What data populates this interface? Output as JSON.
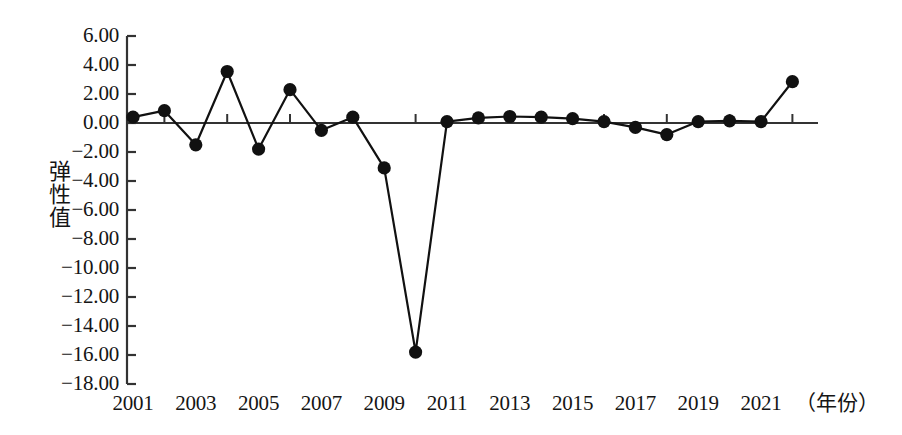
{
  "chart_data": {
    "type": "line",
    "title": "",
    "xlabel": "（年份）",
    "ylabel": "弹性值",
    "x": [
      2001,
      2002,
      2003,
      2004,
      2005,
      2006,
      2007,
      2008,
      2009,
      2010,
      2011,
      2012,
      2013,
      2014,
      2015,
      2016,
      2017,
      2018,
      2019,
      2020,
      2021,
      2022
    ],
    "values": [
      0.4,
      0.85,
      -1.5,
      3.55,
      -1.8,
      2.3,
      -0.5,
      0.4,
      -3.1,
      -15.8,
      0.1,
      0.35,
      0.45,
      0.4,
      0.3,
      0.1,
      -0.3,
      -0.8,
      0.1,
      0.15,
      0.1,
      2.85
    ],
    "series": [
      {
        "name": "弹性值",
        "values": [
          0.4,
          0.85,
          -1.5,
          3.55,
          -1.8,
          2.3,
          -0.5,
          0.4,
          -3.1,
          -15.8,
          0.1,
          0.35,
          0.45,
          0.4,
          0.3,
          0.1,
          -0.3,
          -0.8,
          0.1,
          0.15,
          0.1,
          2.85
        ]
      }
    ],
    "xlim": [
      2000.5,
      2022.6
    ],
    "ylim": [
      -18.0,
      6.0
    ],
    "y_ticks": [
      6.0,
      4.0,
      2.0,
      0.0,
      -2.0,
      -4.0,
      -6.0,
      -8.0,
      -10.0,
      -12.0,
      -14.0,
      -16.0,
      -18.0
    ],
    "y_tick_labels": [
      "6.00",
      "4.00",
      "2.00",
      "0.00",
      "-2.00",
      "-4.00",
      "-6.00",
      "-8.00",
      "-10.00",
      "-12.00",
      "-14.00",
      "-16.00",
      "-18.00"
    ],
    "x_ticks": [
      2001,
      2003,
      2005,
      2007,
      2009,
      2011,
      2013,
      2015,
      2017,
      2019,
      2021
    ],
    "x_tick_labels": [
      "2001",
      "2003",
      "2005",
      "2007",
      "2009",
      "2011",
      "2013",
      "2015",
      "2017",
      "2019",
      "2021"
    ],
    "x_minor_ticks": [
      2002,
      2004,
      2006,
      2008,
      2010,
      2012,
      2014,
      2016,
      2018,
      2020,
      2022
    ],
    "grid": false,
    "legend": null,
    "marker": "filled-circle",
    "line_color": "#111111",
    "marker_color": "#111111",
    "axis_color": "#333333",
    "background_color": "#ffffff"
  },
  "axes": {
    "y_title": "弹性值",
    "x_unit_label": "（年份）"
  }
}
